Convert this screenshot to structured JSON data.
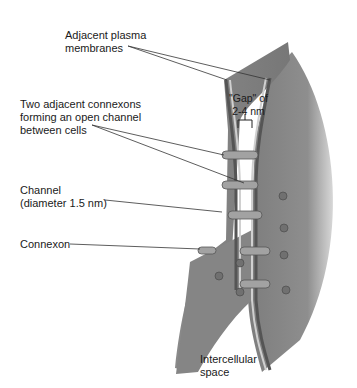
{
  "diagram": {
    "labels": {
      "plasma_membranes": "Adjacent plasma\nmembranes",
      "connexons_channel": "Two adjacent connexons\nforming an open channel\nbetween cells",
      "channel": "Channel\n(diameter 1.5 nm)",
      "connexon": "Connexon",
      "gap": "\"Gap\" of\n2-4 nm",
      "intercellular_space": "Intercellular\nspace"
    },
    "colors": {
      "membrane_fill": "#8c8c8c",
      "membrane_shadow": "#6a6a6a",
      "membrane_edge": "#c9c9c9",
      "connexon": "#9a9a9a",
      "leader_line": "#333333"
    }
  }
}
